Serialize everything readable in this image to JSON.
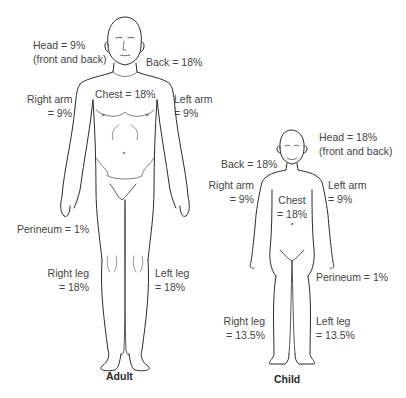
{
  "adult": {
    "caption": "Adult",
    "labels": {
      "head": [
        "Head = 9%",
        "(front and back)"
      ],
      "back": [
        "Back = 18%"
      ],
      "chest": [
        "Chest = 18%"
      ],
      "right_arm": [
        "Right arm",
        "= 9%"
      ],
      "left_arm": [
        "Left arm",
        "= 9%"
      ],
      "perineum": [
        "Perineum = 1%"
      ],
      "right_leg": [
        "Right leg",
        "= 18%"
      ],
      "left_leg": [
        "Left leg",
        "= 18%"
      ]
    }
  },
  "child": {
    "caption": "Child",
    "labels": {
      "head": [
        "Head = 18%",
        "(front and back)"
      ],
      "back": [
        "Back = 18%"
      ],
      "chest": [
        "Chest",
        "= 18%"
      ],
      "right_arm": [
        "Right arm",
        "= 9%"
      ],
      "left_arm": [
        "Left arm",
        "= 9%"
      ],
      "perineum": [
        "Perineum = 1%"
      ],
      "right_leg": [
        "Right leg",
        "= 13.5%"
      ],
      "left_leg": [
        "Left leg",
        "= 13.5%"
      ]
    }
  },
  "colors": {
    "line": "#2b2b2b",
    "text": "#444444"
  }
}
